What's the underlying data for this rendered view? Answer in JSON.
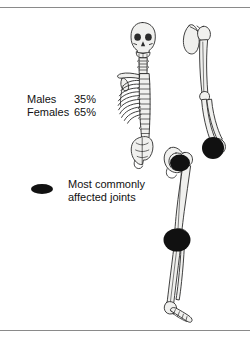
{
  "figure": {
    "background_color": "#ffffff",
    "rule_color": "#8a8a8a",
    "bone_fill": "#f0f0ee",
    "bone_stroke": "#2b2b2b",
    "marker_color": "#111111"
  },
  "stats": {
    "rows": [
      {
        "label": "Males",
        "value": "35%"
      },
      {
        "label": "Females",
        "value": "65%"
      }
    ]
  },
  "legend": {
    "marker_shape": "black-ellipse",
    "line1": "Most commonly",
    "line2": "affected joints"
  },
  "skeleton": {
    "parts": [
      "skull",
      "mandible",
      "cervical-spine",
      "thoracic-spine",
      "lumbar-spine",
      "ribcage",
      "clavicle",
      "sacrum",
      "pelvis",
      "scapula",
      "humerus",
      "radius",
      "ulna",
      "hand",
      "femur",
      "tibia",
      "fibula",
      "foot"
    ]
  },
  "joint_markers": [
    {
      "name": "wrist-joint-marker",
      "label": "wrist",
      "cx": 213,
      "cy": 148,
      "rx": 11,
      "ry": 11
    },
    {
      "name": "hip-joint-marker",
      "label": "hip",
      "cx": 180,
      "cy": 163,
      "rx": 10,
      "ry": 8.5
    },
    {
      "name": "knee-joint-marker",
      "label": "knee",
      "cx": 177,
      "cy": 240,
      "rx": 13.5,
      "ry": 11.5
    }
  ]
}
